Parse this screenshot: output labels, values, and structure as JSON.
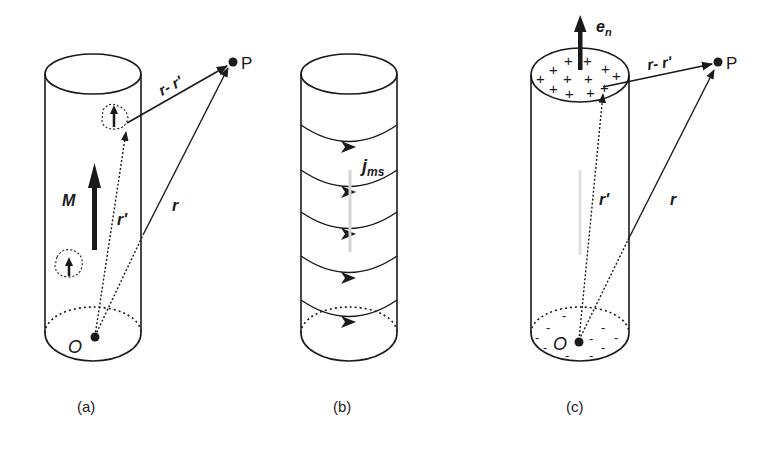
{
  "figure": {
    "panels": [
      {
        "id": "a",
        "caption": "(a)",
        "labels": {
          "point": "P",
          "origin": "O",
          "difference_vector": "r- r'",
          "source_vector": "r'",
          "position_vector": "r",
          "magnetization": "M"
        }
      },
      {
        "id": "b",
        "caption": "(b)",
        "labels": {
          "surface_current": "j",
          "surface_current_sub": "ms"
        }
      },
      {
        "id": "c",
        "caption": "(c)",
        "labels": {
          "point": "P",
          "origin": "O",
          "difference_vector": "r- r'",
          "source_vector": "r'",
          "position_vector": "r",
          "normal": "e",
          "normal_sub": "n",
          "positive_charge": "+",
          "negative_charge": "-"
        }
      }
    ],
    "colors": {
      "stroke": "#1a1a1a",
      "background": "#ffffff"
    }
  }
}
